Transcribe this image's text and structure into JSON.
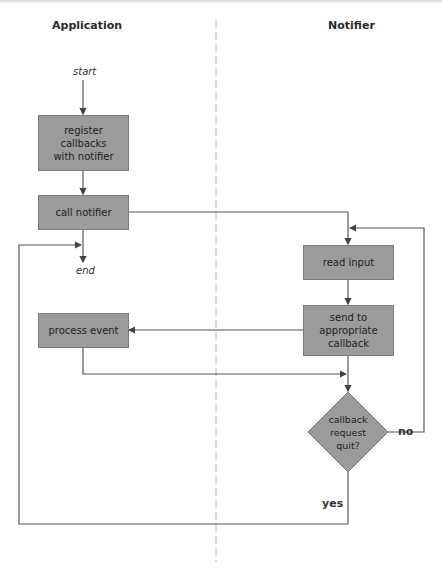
{
  "lanes": {
    "left": "Application",
    "right": "Notifier"
  },
  "terminals": {
    "start": "start",
    "end": "end"
  },
  "nodes": {
    "register": "register\ncallbacks\nwith notifier",
    "call_notifier": "call notifier",
    "read_input": "read input",
    "send_callback": "send to\nappropriate\ncallback",
    "process_event": "process event",
    "decision": "callback\nrequest\nquit?"
  },
  "edge_labels": {
    "yes": "yes",
    "no": "no"
  },
  "colors": {
    "box_fill": "#9b9b9b",
    "line": "#555555",
    "divider": "#b0b0b0"
  }
}
